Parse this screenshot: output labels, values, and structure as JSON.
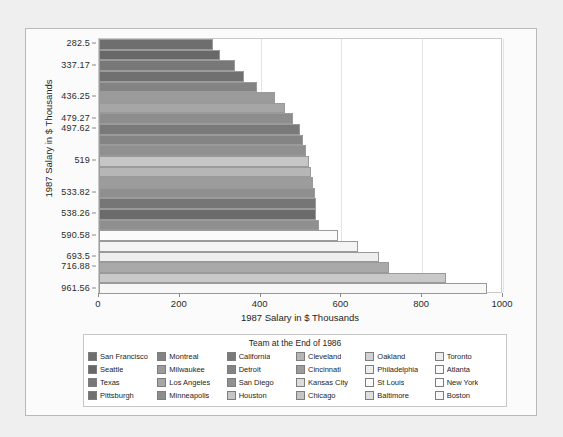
{
  "chart_data": {
    "type": "bar",
    "orientation": "horizontal",
    "title": "",
    "xlabel": "1987 Salary in $ Thousands",
    "ylabel": "1987 Salary in $ Thousands",
    "xlim": [
      0,
      1000
    ],
    "x_ticks": [
      0,
      200,
      400,
      600,
      800,
      1000
    ],
    "grid": true,
    "legend_position": "bottom",
    "legend_title": "Team at the End of 1986",
    "y_tick_labels": [
      "282.5",
      "337.17",
      "436.25",
      "479.27",
      "497.62",
      "519",
      "533.82",
      "538.26",
      "590.58",
      "693.5",
      "716.88",
      "961.56"
    ],
    "categories": [
      "San Francisco",
      "Seattle",
      "Texas",
      "Pittsburgh",
      "Montreal",
      "Milwaukee",
      "Los Angeles",
      "Minneapolis",
      "California",
      "Detroit",
      "San Diego",
      "Houston",
      "Cleveland",
      "Cincinnati",
      "Kansas City",
      "Chicago",
      "Oakland",
      "Philadelphia",
      "St Louis",
      "Baltimore",
      "Toronto",
      "Atlanta",
      "New York",
      "Boston"
    ],
    "values": [
      282.5,
      300.0,
      337.17,
      360.0,
      390.0,
      436.25,
      460.0,
      479.27,
      497.62,
      505.0,
      512.0,
      519.0,
      525.0,
      530.0,
      533.82,
      536.0,
      538.26,
      545.0,
      590.58,
      640.0,
      693.5,
      716.88,
      860.0,
      961.56
    ],
    "bar_colors": [
      "#6e6e6e",
      "#686868",
      "#787878",
      "#707070",
      "#838383",
      "#9b9b9b",
      "#a6a6a6",
      "#8d8d8d",
      "#797979",
      "#848484",
      "#909090",
      "#c6c6c6",
      "#b6b6b6",
      "#9c9c9c",
      "#8f8f8f",
      "#767676",
      "#6b6b6b",
      "#8f8f8f",
      "#fbfbfb",
      "#f4f4f4",
      "#eeeeee",
      "#a9a9a9",
      "#c9c9c9",
      "#f7f7f7"
    ]
  },
  "axes": {
    "y_title": "1987 Salary in $ Thousands",
    "x_title": "1987 Salary in $ Thousands",
    "x_tick_labels": [
      "0",
      "200",
      "400",
      "600",
      "800",
      "1000"
    ],
    "y_tick_labels": [
      "282.5",
      "337.17",
      "436.25",
      "479.27",
      "497.62",
      "519",
      "533.82",
      "538.26",
      "590.58",
      "693.5",
      "716.88",
      "961.56"
    ]
  },
  "legend": {
    "title": "Team at the End of 1986",
    "items": [
      {
        "label": "San Francisco",
        "color": "#6e6e6e"
      },
      {
        "label": "Seattle",
        "color": "#686868"
      },
      {
        "label": "Texas",
        "color": "#787878"
      },
      {
        "label": "Pittsburgh",
        "color": "#707070"
      },
      {
        "label": "Montreal",
        "color": "#838383"
      },
      {
        "label": "Milwaukee",
        "color": "#9b9b9b"
      },
      {
        "label": "Los Angeles",
        "color": "#a6a6a6"
      },
      {
        "label": "Minneapolis",
        "color": "#8d8d8d"
      },
      {
        "label": "California",
        "color": "#797979"
      },
      {
        "label": "Detroit",
        "color": "#848484"
      },
      {
        "label": "San Diego",
        "color": "#909090"
      },
      {
        "label": "Houston",
        "color": "#c6c6c6"
      },
      {
        "label": "Cleveland",
        "color": "#b6b6b6"
      },
      {
        "label": "Cincinnati",
        "color": "#9c9c9c"
      },
      {
        "label": "Kansas City",
        "color": "#dcdcdc"
      },
      {
        "label": "Chicago",
        "color": "#c4c4c4"
      },
      {
        "label": "Oakland",
        "color": "#d2d2d2"
      },
      {
        "label": "Philadelphia",
        "color": "#ededed"
      },
      {
        "label": "St Louis",
        "color": "#fbfbfb"
      },
      {
        "label": "Baltimore",
        "color": "#dfdfdf"
      },
      {
        "label": "Toronto",
        "color": "#ededed"
      },
      {
        "label": "Atlanta",
        "color": "#fafafa"
      },
      {
        "label": "New York",
        "color": "#fcfcfc"
      },
      {
        "label": "Boston",
        "color": "#f7f7f7"
      }
    ]
  }
}
